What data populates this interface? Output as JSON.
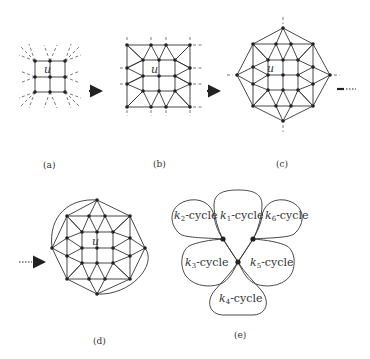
{
  "figure": {
    "panels": [
      {
        "id": "a",
        "caption": "(a)",
        "center_label": "u"
      },
      {
        "id": "b",
        "caption": "(b)",
        "center_label": "u"
      },
      {
        "id": "c",
        "caption": "(c)",
        "center_label": "u"
      },
      {
        "id": "d",
        "caption": "(d)",
        "center_label": "u"
      },
      {
        "id": "e",
        "caption": "(e)"
      }
    ],
    "cycles": [
      {
        "k": "k",
        "sub": "1",
        "text": "-cycle"
      },
      {
        "k": "k",
        "sub": "2",
        "text": "-cycle"
      },
      {
        "k": "k",
        "sub": "3",
        "text": "-cycle"
      },
      {
        "k": "k",
        "sub": "4",
        "text": "-cycle"
      },
      {
        "k": "k",
        "sub": "5",
        "text": "-cycle"
      },
      {
        "k": "k",
        "sub": "6",
        "text": "-cycle"
      }
    ],
    "colors": {
      "ink": "#222222",
      "background": "#ffffff"
    }
  }
}
